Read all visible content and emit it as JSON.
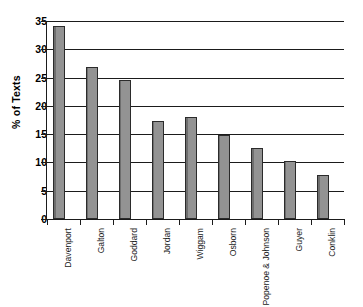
{
  "chart_data": {
    "type": "bar",
    "title": "",
    "xlabel": "",
    "ylabel": "% of Texts",
    "ylim": [
      0,
      35
    ],
    "yticks": [
      0,
      5,
      10,
      15,
      20,
      25,
      30,
      35
    ],
    "ytick_labels": [
      "0",
      "5",
      "10",
      "15",
      "20",
      "25",
      "30",
      "35"
    ],
    "grid": "horizontal",
    "legend": "none",
    "bar_color": "#8a8a8a",
    "bar_edge_color": "#2b2b2b",
    "axis_color": "#1b1b1b",
    "categories": [
      "Davenport",
      "Galton",
      "Goddard",
      "Jordan",
      "Wiggam",
      "Osborn",
      "Popenoe & Johnson",
      "Guyer",
      "Conklin"
    ],
    "values": [
      34.2,
      26.8,
      24.5,
      17.3,
      18.0,
      14.9,
      12.5,
      10.3,
      7.7
    ]
  }
}
